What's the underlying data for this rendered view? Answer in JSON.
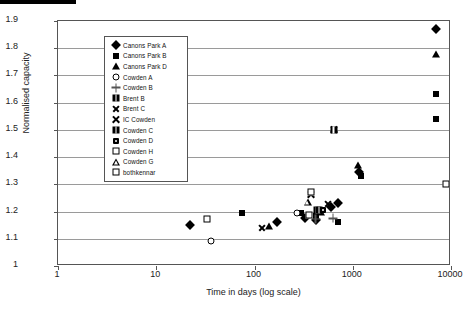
{
  "chart_data": {
    "type": "scatter",
    "title": "",
    "xlabel": "Time in days (log scale)",
    "ylabel": "Normalised capacity",
    "xscale": "log",
    "xlim": [
      1,
      10000
    ],
    "xticks": [
      1,
      10,
      100,
      1000,
      10000
    ],
    "xtick_labels": [
      "1",
      "10",
      "100",
      "1000",
      "10000"
    ],
    "ylim": [
      1,
      1.9
    ],
    "yticks": [
      1,
      1.1,
      1.2,
      1.3,
      1.4,
      1.5,
      1.6,
      1.7,
      1.8,
      1.9
    ],
    "ytick_labels": [
      "1",
      "1.1",
      "1.2",
      "1.3",
      "1.4",
      "1.5",
      "1.6",
      "1.7",
      "1.8",
      "1.9"
    ],
    "grid": "horizontal",
    "legend_position": "upper-left-inside",
    "series": [
      {
        "name": "Canons Park A",
        "marker": "diamond",
        "points": [
          {
            "x": 22,
            "y": 1.151
          },
          {
            "x": 170,
            "y": 1.163
          },
          {
            "x": 330,
            "y": 1.176
          },
          {
            "x": 420,
            "y": 1.168
          },
          {
            "x": 600,
            "y": 1.215
          },
          {
            "x": 700,
            "y": 1.232
          },
          {
            "x": 1150,
            "y": 1.345
          },
          {
            "x": 7000,
            "y": 1.871
          }
        ]
      },
      {
        "name": "Canons Park B",
        "marker": "square",
        "points": [
          {
            "x": 75,
            "y": 1.196
          },
          {
            "x": 300,
            "y": 1.195
          },
          {
            "x": 420,
            "y": 1.185
          },
          {
            "x": 700,
            "y": 1.162
          },
          {
            "x": 1200,
            "y": 1.329
          },
          {
            "x": 7000,
            "y": 1.631
          },
          {
            "x": 7000,
            "y": 1.539
          }
        ]
      },
      {
        "name": "Canons Park D",
        "marker": "triangle",
        "points": [
          {
            "x": 140,
            "y": 1.147
          },
          {
            "x": 480,
            "y": 1.199
          },
          {
            "x": 1120,
            "y": 1.372
          },
          {
            "x": 7000,
            "y": 1.779
          }
        ]
      },
      {
        "name": "Cowden A",
        "marker": "open-circle",
        "points": [
          {
            "x": 36,
            "y": 1.092
          },
          {
            "x": 270,
            "y": 1.196
          },
          {
            "x": 460,
            "y": 1.203
          }
        ]
      },
      {
        "name": "Cowden B",
        "marker": "plus",
        "points": [
          {
            "x": 420,
            "y": 1.172
          },
          {
            "x": 630,
            "y": 1.175
          }
        ]
      },
      {
        "name": "Brent B",
        "marker": "boxed-square",
        "points": [
          {
            "x": 430,
            "y": 1.207
          },
          {
            "x": 455,
            "y": 1.206
          }
        ]
      },
      {
        "name": "Brent C",
        "marker": "ex",
        "points": [
          {
            "x": 118,
            "y": 1.139
          },
          {
            "x": 560,
            "y": 1.227
          }
        ]
      },
      {
        "name": "IC Cowden",
        "marker": "bold-ex",
        "points": [
          {
            "x": 380,
            "y": 1.262
          },
          {
            "x": 640,
            "y": 1.5
          }
        ]
      },
      {
        "name": "Cowden C",
        "marker": "boxed-square",
        "points": [
          {
            "x": 640,
            "y": 1.5
          }
        ]
      },
      {
        "name": "Cowden D",
        "marker": "dot-square",
        "points": [
          {
            "x": 500,
            "y": 1.205
          }
        ]
      },
      {
        "name": "Cowden H",
        "marker": "open-square",
        "points": [
          {
            "x": 33,
            "y": 1.172
          },
          {
            "x": 360,
            "y": 1.188
          }
        ]
      },
      {
        "name": "Cowden G",
        "marker": "open-triangle",
        "points": [
          {
            "x": 350,
            "y": 1.235
          }
        ]
      },
      {
        "name": "bothkennar",
        "marker": "open-square",
        "points": [
          {
            "x": 380,
            "y": 1.272
          },
          {
            "x": 8800,
            "y": 1.302
          }
        ]
      }
    ]
  },
  "legend": {
    "entries": [
      {
        "label": "Canons Park A",
        "marker": "diamond"
      },
      {
        "label": "Canons Park B",
        "marker": "square"
      },
      {
        "label": "Canons Park D",
        "marker": "triangle"
      },
      {
        "label": "Cowden A",
        "marker": "open-circle"
      },
      {
        "label": "Cowden B",
        "marker": "plus"
      },
      {
        "label": "Brent B",
        "marker": "boxed-square"
      },
      {
        "label": "Brent C",
        "marker": "ex"
      },
      {
        "label": "IC Cowden",
        "marker": "bold-ex"
      },
      {
        "label": "Cowden C",
        "marker": "boxed-square"
      },
      {
        "label": "Cowden D",
        "marker": "dot-square"
      },
      {
        "label": "Cowden H",
        "marker": "open-square"
      },
      {
        "label": "Cowden G",
        "marker": "open-triangle"
      },
      {
        "label": "bothkennar",
        "marker": "open-square"
      }
    ]
  },
  "colors": {
    "marker": "#000000",
    "gridline": "#9a9a9a",
    "axis": "#555555",
    "text": "#222222",
    "background": "#ffffff"
  }
}
